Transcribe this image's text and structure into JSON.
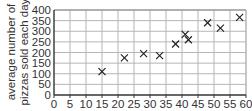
{
  "chart_data": {
    "type": "scatter",
    "title": "",
    "xlabel": "",
    "ylabel": "average number of pizzas sold each day",
    "ylabel_lines": [
      "average number of",
      "pizzas sold each day"
    ],
    "xlim": [
      0,
      60
    ],
    "ylim": [
      0,
      400
    ],
    "x_ticks": [
      0,
      5,
      10,
      15,
      20,
      25,
      30,
      35,
      40,
      45,
      50,
      55,
      60
    ],
    "y_ticks": [
      0,
      50,
      100,
      150,
      200,
      250,
      300,
      350,
      400
    ],
    "grid": true,
    "legend": null,
    "marker": "x",
    "points": [
      {
        "x": 15,
        "y": 110
      },
      {
        "x": 22,
        "y": 175
      },
      {
        "x": 28,
        "y": 195
      },
      {
        "x": 33,
        "y": 185
      },
      {
        "x": 38,
        "y": 240
      },
      {
        "x": 41,
        "y": 285
      },
      {
        "x": 42,
        "y": 260
      },
      {
        "x": 48,
        "y": 340
      },
      {
        "x": 52,
        "y": 315
      },
      {
        "x": 58,
        "y": 365
      }
    ]
  },
  "style": {
    "axis_color": "#333333",
    "grid_color": "#b5b5b5",
    "marker_color": "#222222",
    "text_color": "#333333"
  }
}
